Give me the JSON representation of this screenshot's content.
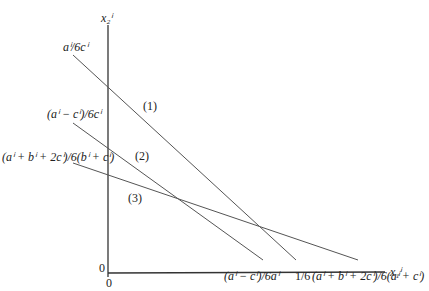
{
  "diagram": {
    "axes": {
      "y_label": "x₂ⁱ",
      "x_label": "x₁ⁱ",
      "origin_y": "0",
      "origin_x": "0"
    },
    "y_intercepts": [
      "aⁱ/6cⁱ",
      "(aⁱ − cⁱ)/6cⁱ",
      "(aⁱ + bⁱ + 2cⁱ)/6(bⁱ + cⁱ)"
    ],
    "x_intercepts": [
      "(aⁱ − cⁱ)/6aⁱ",
      "1/6",
      "(aⁱ + bⁱ + 2cⁱ)/6(aⁱ + cⁱ)"
    ],
    "line_labels": [
      "(1)",
      "(2)",
      "(3)"
    ],
    "colors": {
      "axis": "#333333",
      "line": "#555555",
      "text": "#222222"
    }
  }
}
